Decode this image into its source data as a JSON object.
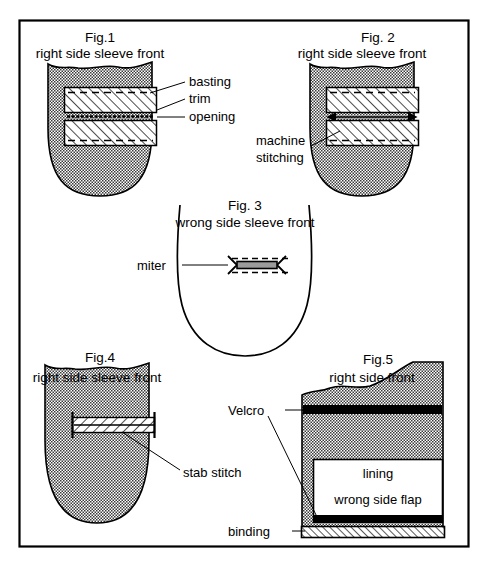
{
  "document": {
    "type": "sewing-instruction-diagram",
    "panel_border_color": "#000000",
    "fabric_fill_color": "#a8a8a8",
    "ink_color": "#000000"
  },
  "figures": [
    {
      "id": "fig1",
      "title": "Fig.1",
      "subtitle": "right side sleeve front",
      "labels": [
        {
          "name": "basting",
          "text": "basting"
        },
        {
          "name": "trim",
          "text": "trim"
        },
        {
          "name": "opening",
          "text": "opening"
        }
      ]
    },
    {
      "id": "fig2",
      "title": "Fig. 2",
      "subtitle": "right side sleeve front",
      "labels": [
        {
          "name": "machine-stitching-line1",
          "text": "machine"
        },
        {
          "name": "machine-stitching-line2",
          "text": "stitching"
        }
      ]
    },
    {
      "id": "fig3",
      "title": "Fig. 3",
      "subtitle": "wrong side sleeve front",
      "labels": [
        {
          "name": "miter",
          "text": "miter"
        }
      ]
    },
    {
      "id": "fig4",
      "title": "Fig.4",
      "subtitle": "right side sleeve front",
      "labels": [
        {
          "name": "stab-stitch",
          "text": "stab stitch"
        }
      ]
    },
    {
      "id": "fig5",
      "title": "Fig.5",
      "subtitle": "right side front",
      "labels": [
        {
          "name": "velcro",
          "text": "Velcro"
        },
        {
          "name": "lining",
          "text": "lining"
        },
        {
          "name": "wrong-side-flap",
          "text": "wrong side flap"
        },
        {
          "name": "binding",
          "text": "binding"
        }
      ]
    }
  ]
}
